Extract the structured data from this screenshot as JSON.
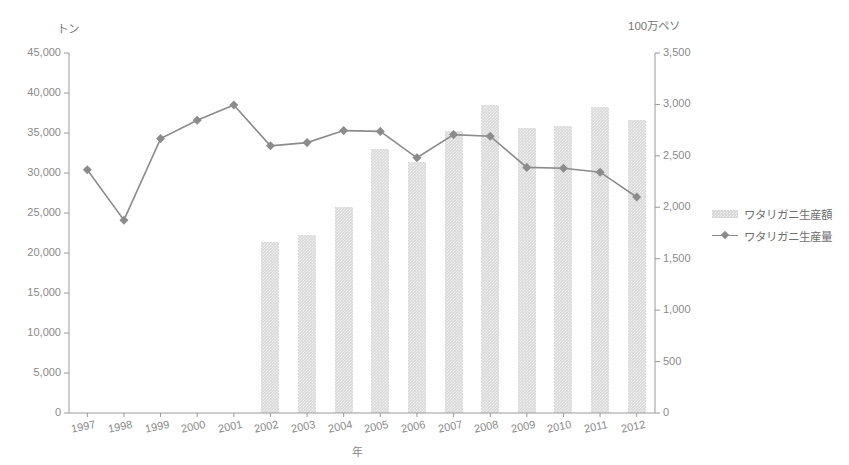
{
  "chart_data": {
    "type": "bar",
    "title": "",
    "xlabel": "年",
    "ylabel": "トン",
    "ylabel_right": "100万ペソ",
    "grid": false,
    "legend_position": "right",
    "categories": [
      "1997",
      "1998",
      "1999",
      "2000",
      "2001",
      "2002",
      "2003",
      "2004",
      "2005",
      "2006",
      "2007",
      "2008",
      "2009",
      "2010",
      "2011",
      "2012"
    ],
    "ylim": [
      0,
      45000
    ],
    "ylim_right": [
      0,
      3500
    ],
    "yticks": [
      "0",
      "5,000",
      "10,000",
      "15,000",
      "20,000",
      "25,000",
      "30,000",
      "35,000",
      "40,000",
      "45,000"
    ],
    "yticks_right": [
      "0",
      "500",
      "1,000",
      "1,500",
      "2,000",
      "2,500",
      "3,000",
      "3,500"
    ],
    "series": [
      {
        "name": "ワタリガニ生産額",
        "type": "bar",
        "axis": "right",
        "unit": "100万ペソ",
        "color": "#d9d9d9",
        "values": [
          null,
          null,
          null,
          null,
          null,
          1660,
          1730,
          2000,
          2570,
          2440,
          2740,
          2990,
          2770,
          2790,
          2980,
          2850
        ]
      },
      {
        "name": "ワタリガニ生産量",
        "type": "line",
        "axis": "left",
        "unit": "トン",
        "color": "#8c8c8c",
        "values": [
          30400,
          24100,
          34300,
          36600,
          38500,
          33400,
          33800,
          35300,
          35200,
          31900,
          34800,
          34600,
          30700,
          30600,
          30100,
          27000
        ]
      }
    ]
  },
  "legend": {
    "items": [
      {
        "label": "ワタリガニ生産額",
        "marker": "bar-swatch"
      },
      {
        "label": "ワタリガニ生産量",
        "marker": "line-diamond-swatch"
      }
    ]
  },
  "axes": {
    "left_unit": "トン",
    "right_unit": "100万ペソ",
    "x_title": "年"
  }
}
